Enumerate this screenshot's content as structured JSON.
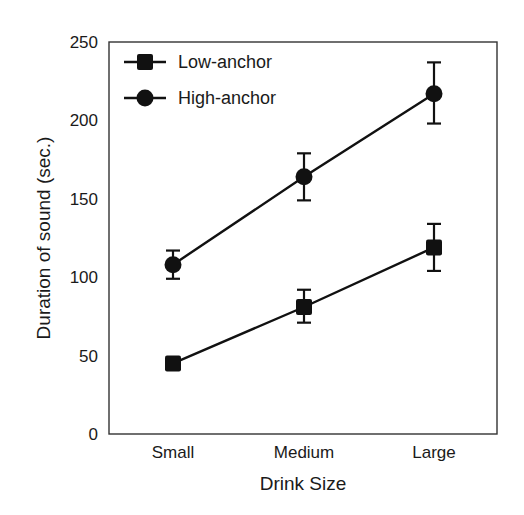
{
  "chart_data": {
    "type": "line",
    "title": "",
    "xlabel": "Drink Size",
    "ylabel": "Duration of sound (sec.)",
    "categories": [
      "Small",
      "Medium",
      "Large"
    ],
    "ylim": [
      0,
      250
    ],
    "yticks": [
      0,
      50,
      100,
      150,
      200,
      250
    ],
    "grid": false,
    "legend_position": "upper left",
    "series": [
      {
        "name": "Low-anchor",
        "marker": "square",
        "values": [
          45,
          81,
          119
        ],
        "error_low": [
          42,
          71,
          104
        ],
        "error_high": [
          48,
          92,
          134
        ]
      },
      {
        "name": "High-anchor",
        "marker": "circle",
        "values": [
          108,
          164,
          217
        ],
        "error_low": [
          99,
          149,
          198
        ],
        "error_high": [
          117,
          179,
          237
        ]
      }
    ]
  },
  "colors": {
    "ink": "#111111",
    "axis": "#333333",
    "background": "#ffffff"
  }
}
